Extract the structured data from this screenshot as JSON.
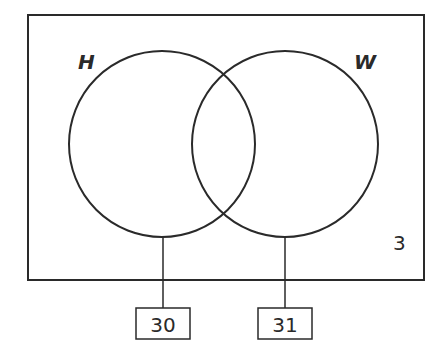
{
  "diagram": {
    "type": "venn",
    "universal_set": {
      "outside_count": "3"
    },
    "sets": [
      {
        "label": "H",
        "callout": "30"
      },
      {
        "label": "W",
        "callout": "31"
      }
    ],
    "colors": {
      "stroke": "#2a2a2a",
      "background": "#ffffff"
    }
  }
}
